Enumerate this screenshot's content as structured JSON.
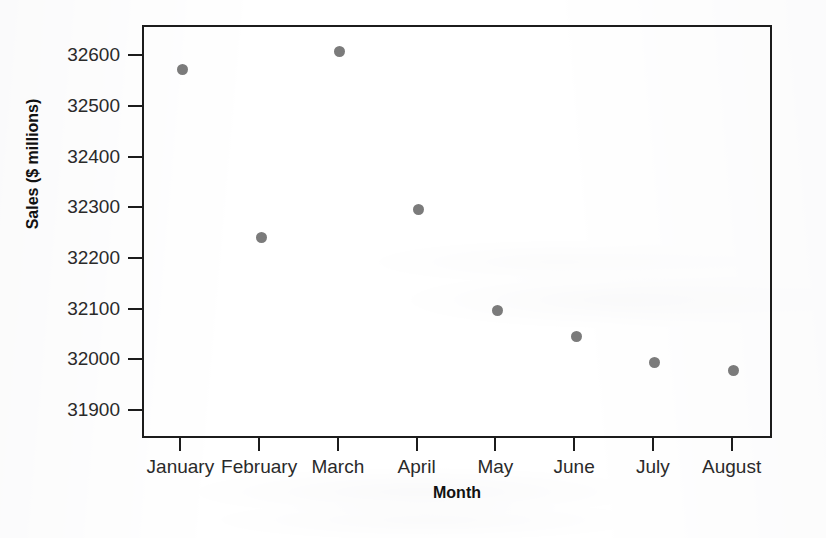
{
  "chart_data": {
    "type": "scatter",
    "title": "",
    "xlabel": "Month",
    "ylabel": "Sales ($ millions)",
    "categories": [
      "January",
      "February",
      "March",
      "April",
      "May",
      "June",
      "July",
      "August"
    ],
    "values": [
      32577,
      32245,
      32612,
      32300,
      32100,
      32050,
      31997,
      31982
    ],
    "series": [
      {
        "name": "Sales",
        "values": [
          32577,
          32245,
          32612,
          32300,
          32100,
          32050,
          31997,
          31982
        ],
        "marker": "circle",
        "color": "#7b7b7b"
      }
    ],
    "ylim": [
      31845,
      32660
    ],
    "yticks": [
      31900,
      32000,
      32100,
      32200,
      32300,
      32400,
      32500,
      32600
    ],
    "ytick_labels": [
      "31900",
      "32000",
      "32100",
      "32200",
      "32300",
      "32400",
      "32500",
      "32600"
    ],
    "xtick_labels": [
      "January",
      "February",
      "March",
      "April",
      "May",
      "June",
      "July",
      "August"
    ],
    "grid": false,
    "legend": false,
    "frame_color": "#1c1c1c"
  },
  "axes": {
    "y_title": "Sales ($ millions)",
    "x_title": "Month"
  }
}
